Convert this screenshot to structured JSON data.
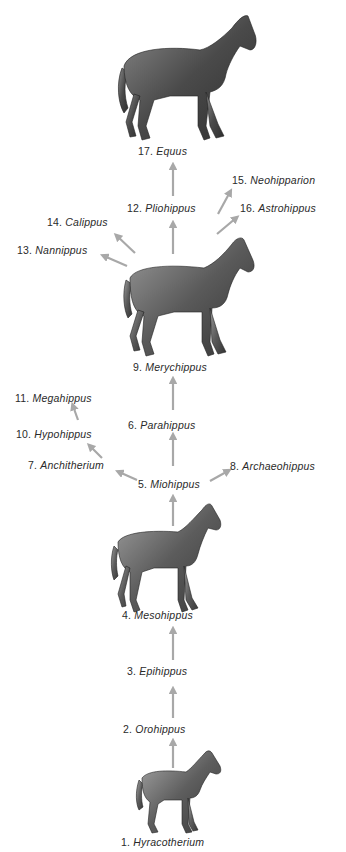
{
  "colors": {
    "arrow": "#a8a8a8",
    "horse_dark": "#3a3a3a",
    "horse_mid": "#6e6e6e",
    "horse_light": "#a9a9a9",
    "text": "#2a2a2a"
  },
  "taxa": [
    {
      "num": "1.",
      "name": "Hyracotherium"
    },
    {
      "num": "2.",
      "name": "Orohippus"
    },
    {
      "num": "3.",
      "name": "Epihippus"
    },
    {
      "num": "4.",
      "name": "Mesohippus"
    },
    {
      "num": "5.",
      "name": "Miohippus"
    },
    {
      "num": "6.",
      "name": "Parahippus"
    },
    {
      "num": "7.",
      "name": "Anchitherium"
    },
    {
      "num": "8.",
      "name": "Archaeohippus"
    },
    {
      "num": "9.",
      "name": "Merychippus"
    },
    {
      "num": "10.",
      "name": "Hypohippus"
    },
    {
      "num": "11.",
      "name": "Megahippus"
    },
    {
      "num": "12.",
      "name": "Pliohippus"
    },
    {
      "num": "13.",
      "name": "Nannippus"
    },
    {
      "num": "14.",
      "name": "Calippus"
    },
    {
      "num": "15.",
      "name": "Neohipparion"
    },
    {
      "num": "16.",
      "name": "Astrohippus"
    },
    {
      "num": "17.",
      "name": "Equus"
    }
  ],
  "illustrations": [
    {
      "id": "equus",
      "label": "17. Equus"
    },
    {
      "id": "merychippus",
      "label": "9. Merychippus"
    },
    {
      "id": "mesohippus",
      "label": "4. Mesohippus"
    },
    {
      "id": "hyracotherium",
      "label": "1. Hyracotherium"
    }
  ]
}
